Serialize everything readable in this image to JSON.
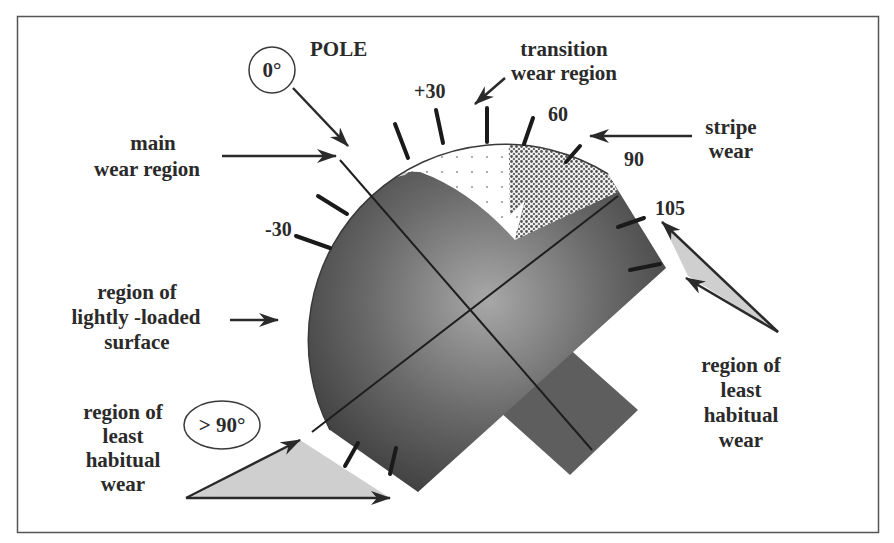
{
  "figure": {
    "frame": {
      "x": 17,
      "y": 16,
      "width": 862,
      "height": 517
    }
  },
  "labels": {
    "pole": "POLE",
    "pole_angle": "0°",
    "main_wear": [
      "main",
      "wear region"
    ],
    "transition_wear": [
      "transition",
      "wear region"
    ],
    "stripe_wear": [
      "stripe",
      "wear"
    ],
    "lightly_loaded": [
      "region of",
      "lightly -loaded",
      "surface"
    ],
    "least_habitual_left": [
      "region of",
      "least",
      "habitual",
      "wear"
    ],
    "least_habitual_right": [
      "region of",
      "least",
      "habitual",
      "wear"
    ],
    "least_angle": "> 90°"
  },
  "ticks": {
    "minus30": "-30",
    "plus30": "+30",
    "t60": "60",
    "t90": "90",
    "t105": "105"
  },
  "colors": {
    "frame": "#555555",
    "sphere_dark": "#4a4a4a",
    "sphere_light": "#9a9a9a",
    "main_wear_fill": "#d9d9d9",
    "transition_fill": "#ffffff",
    "stripe_fill": "#bdbdbd",
    "least_wear_fill": "#cfcfcf",
    "ink": "#2a2a2a"
  }
}
